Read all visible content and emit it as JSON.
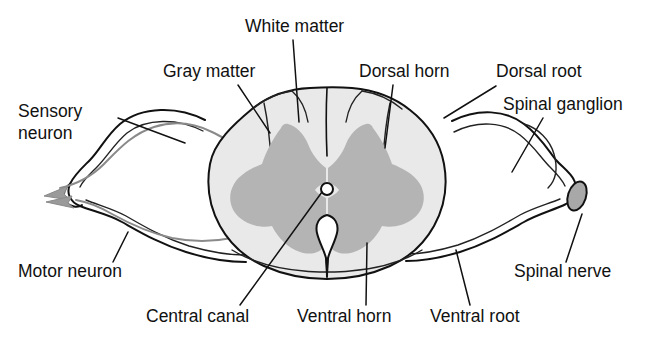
{
  "figure": {
    "background_color": "#ffffff",
    "text_color": "#111111",
    "white_matter_color": "#e9e9e9",
    "gray_matter_color": "#b4b4b4",
    "nerve_fill_color": "#e2e2e2",
    "nerve_trace_color": "#8a8a8a",
    "outline_color": "#111111"
  },
  "labels": {
    "sensory_neuron_line1": "Sensory",
    "sensory_neuron_line2": "neuron",
    "gray_matter": "Gray matter",
    "white_matter": "White matter",
    "dorsal_horn": "Dorsal horn",
    "dorsal_root": "Dorsal root",
    "spinal_ganglion": "Spinal ganglion",
    "spinal_nerve": "Spinal nerve",
    "ventral_root": "Ventral root",
    "ventral_horn": "Ventral horn",
    "central_canal": "Central canal",
    "motor_neuron": "Motor neuron"
  }
}
